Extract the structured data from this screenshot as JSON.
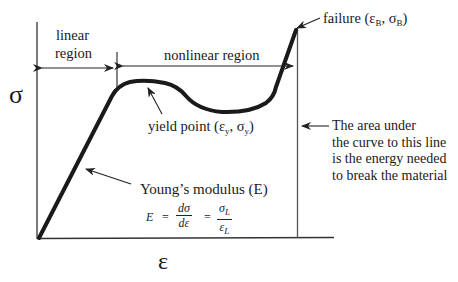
{
  "diagram": {
    "axes": {
      "y_symbol": "σ",
      "x_symbol": "ε"
    },
    "regions": {
      "linear": [
        "linear",
        "region"
      ],
      "nonlinear": "nonlinear region"
    },
    "annotations": {
      "failure": {
        "text": "failure (",
        "eps": "ε",
        "eps_sub": "B",
        "sep": ", ",
        "sig": "σ",
        "sig_sub": "B",
        "close": ")"
      },
      "yield": {
        "text": "yield point (",
        "eps": "ε",
        "eps_sub": "y",
        "sep": ", ",
        "sig": "σ",
        "sig_sub": "y",
        "close": ")"
      },
      "youngs": "Young’s modulus (E)",
      "energy": [
        "The area under",
        "the curve to this line",
        "is the energy needed",
        "to break the material"
      ]
    },
    "equation": {
      "lhs": "E",
      "eq1": "=",
      "frac1_num": "dσ",
      "frac1_den": "dε",
      "eq2": "=",
      "frac2_num": "σ",
      "frac2_num_sub": "L",
      "frac2_den": "ε",
      "frac2_den_sub": "L"
    },
    "colors": {
      "curve": "#1a1a1a",
      "axis": "#333333",
      "background": "#ffffff"
    }
  }
}
